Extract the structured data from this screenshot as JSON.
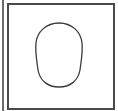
{
  "figure": {
    "shape": "oval-outline",
    "description_icon": "face-outline-icon",
    "colors": {
      "frame": "#4a4a4a",
      "stroke": "#3a3a3a",
      "background": "#ffffff"
    }
  }
}
